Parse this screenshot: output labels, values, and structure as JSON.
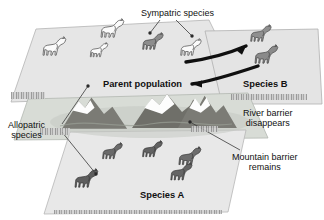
{
  "figure": {
    "background_color": "#ffffff"
  },
  "labels": {
    "sympatric": "Sympatric species",
    "parent_population": "Parent population",
    "species_b": "Species B",
    "species_a": "Species A",
    "river_barrier": "River barrier\ndisappears",
    "mountain_barrier": "Mountain barrier\nremains",
    "allopatric": "Allopatric\nspecies"
  },
  "planes": [
    {
      "name": "parent-population-plane",
      "fill": "#e6e6e6",
      "stroke": "#b4b4b4"
    },
    {
      "name": "species-b-plane",
      "fill": "#e4e4e4",
      "stroke": "#b0b0b0"
    },
    {
      "name": "mountain-barrier-plane",
      "fill": "#d8dcd6",
      "stroke": "#b3b7b1"
    },
    {
      "name": "species-a-plane",
      "fill": "#e8e8e8",
      "stroke": "#b6b6b6"
    }
  ],
  "horse_groups": [
    {
      "name": "parent-population-horses",
      "plane": "parent-population-plane",
      "count": 5,
      "style": "outline",
      "fill": "#fbfbfb",
      "stroke": "#555555",
      "note": "two of them are shaded gray (sympatric pair markers)"
    },
    {
      "name": "species-b-horses",
      "plane": "species-b-plane",
      "count": 2,
      "style": "solid",
      "fill": "#8f8f8f",
      "stroke": "#4a4a4a"
    },
    {
      "name": "species-a-horses",
      "plane": "species-a-plane",
      "count": 5,
      "style": "solid",
      "fill": "#666666",
      "stroke": "#3a3a3a"
    }
  ],
  "mountains": {
    "name": "mountain-range",
    "peaks": 4,
    "rock_color": "#7b7b75",
    "snow_color": "#fdfdfd",
    "shadow_color": "#c4c8c2"
  },
  "arrows": [
    {
      "name": "gene-flow-arrow-to-species-b",
      "direction": "right",
      "color": "#101010"
    },
    {
      "name": "gene-flow-arrow-to-parent",
      "direction": "left",
      "color": "#101010"
    }
  ],
  "leader_lines": [
    {
      "name": "leader-sympatric-left",
      "color": "#3a3a3a"
    },
    {
      "name": "leader-sympatric-right",
      "color": "#3a3a3a"
    },
    {
      "name": "leader-allopatric-upper",
      "color": "#3a3a3a"
    },
    {
      "name": "leader-allopatric-lower",
      "color": "#3a3a3a"
    },
    {
      "name": "leader-mountain-barrier",
      "color": "#3a3a3a"
    }
  ],
  "caption_strips": [
    {
      "name": "caption-strip-left",
      "legible": false
    },
    {
      "name": "caption-strip-right",
      "legible": false
    },
    {
      "name": "caption-strip-center-left",
      "legible": false
    },
    {
      "name": "caption-strip-center-right",
      "legible": false
    },
    {
      "name": "caption-strip-bottom",
      "legible": false
    }
  ]
}
